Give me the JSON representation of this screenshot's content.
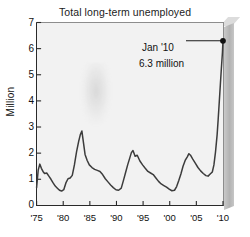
{
  "chart_data": {
    "type": "line",
    "title": "Total long-term unemployed",
    "xlabel": "",
    "ylabel": "Million",
    "xlim": [
      1975,
      2010.08
    ],
    "ylim": [
      0,
      7
    ],
    "grid": false,
    "legend": null,
    "y_ticks": [
      0,
      1,
      2,
      3,
      4,
      5,
      6,
      7
    ],
    "y_tick_labels": [
      "0",
      "1",
      "2",
      "3",
      "4",
      "5",
      "6",
      "7"
    ],
    "x_ticks": [
      1975,
      1980,
      1985,
      1990,
      1995,
      2000,
      2005,
      2010
    ],
    "x_tick_labels": [
      "'75",
      "'80",
      "'85",
      "'90",
      "'95",
      "'00",
      "'05",
      "'10"
    ],
    "units": "millions of persons",
    "annotations": [
      {
        "name": "final-point-callout",
        "line1": "Jan '10",
        "line2": "6.3 million",
        "x": 2010.0,
        "y": 6.3,
        "marker": "filled-circle",
        "leader": "horizontal-line-to-marker"
      }
    ],
    "series": [
      {
        "name": "Total long-term unemployed",
        "color": "#3c3c3c",
        "x": [
          1975.0,
          1975.3,
          1975.6,
          1975.9,
          1976.2,
          1976.5,
          1976.9,
          1977.3,
          1977.7,
          1978.1,
          1978.5,
          1978.9,
          1979.3,
          1979.7,
          1980.1,
          1980.5,
          1980.9,
          1981.3,
          1981.7,
          1982.1,
          1982.5,
          1982.9,
          1983.2,
          1983.5,
          1983.8,
          1984.1,
          1984.5,
          1984.9,
          1985.4,
          1985.9,
          1986.4,
          1986.9,
          1987.4,
          1987.9,
          1988.4,
          1988.9,
          1989.4,
          1989.9,
          1990.4,
          1990.9,
          1991.3,
          1991.7,
          1992.1,
          1992.5,
          1992.8,
          1993.1,
          1993.5,
          1993.9,
          1994.4,
          1994.9,
          1995.4,
          1995.9,
          1996.4,
          1996.9,
          1997.4,
          1997.9,
          1998.4,
          1998.9,
          1999.4,
          1999.9,
          2000.4,
          2000.9,
          2001.3,
          2001.7,
          2002.1,
          2002.5,
          2002.9,
          2003.3,
          2003.6,
          2003.9,
          2004.3,
          2004.8,
          2005.3,
          2005.8,
          2006.3,
          2006.8,
          2007.2,
          2007.6,
          2008.0,
          2008.3,
          2008.6,
          2008.9,
          2009.1,
          2009.3,
          2009.5,
          2009.7,
          2009.9,
          2010.0
        ],
        "y": [
          0.68,
          1.35,
          1.58,
          1.42,
          1.3,
          1.22,
          1.24,
          1.12,
          1.0,
          0.86,
          0.74,
          0.66,
          0.58,
          0.55,
          0.6,
          0.86,
          1.02,
          1.05,
          1.15,
          1.55,
          2.05,
          2.45,
          2.7,
          2.85,
          2.4,
          1.95,
          1.72,
          1.55,
          1.45,
          1.38,
          1.34,
          1.3,
          1.18,
          1.02,
          0.9,
          0.78,
          0.68,
          0.6,
          0.58,
          0.66,
          0.95,
          1.25,
          1.55,
          1.82,
          2.02,
          2.1,
          1.88,
          1.92,
          1.7,
          1.55,
          1.42,
          1.3,
          1.24,
          1.18,
          1.05,
          0.92,
          0.82,
          0.76,
          0.7,
          0.62,
          0.56,
          0.58,
          0.72,
          0.95,
          1.2,
          1.5,
          1.72,
          1.86,
          1.98,
          1.92,
          1.78,
          1.62,
          1.45,
          1.32,
          1.22,
          1.14,
          1.12,
          1.2,
          1.28,
          1.55,
          2.05,
          2.7,
          3.3,
          3.95,
          4.6,
          5.25,
          5.85,
          6.3
        ]
      }
    ]
  },
  "axis": {
    "y_label": "Million",
    "y_tick_labels": [
      "7",
      "6",
      "5",
      "4",
      "3",
      "2",
      "1",
      "0"
    ],
    "x_tick_labels": [
      "'75",
      "'80",
      "'85",
      "'90",
      "'95",
      "'00",
      "'05",
      "'10"
    ]
  },
  "annotation": {
    "line1": "Jan '10",
    "line2": "6.3 million"
  },
  "colors": {
    "line": "#3c3c3c",
    "plot_background": "#f2f2f2",
    "axis": "#2a2a2a",
    "page_background": "#ffffff",
    "slab": "#c0c0c0"
  }
}
